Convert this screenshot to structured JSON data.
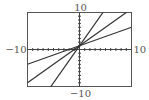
{
  "chart_data": {
    "type": "line",
    "title": "",
    "xlabel": "",
    "ylabel": "",
    "xlim": [
      -10,
      10
    ],
    "ylim": [
      -10,
      10
    ],
    "tick_step": 1,
    "grid": false,
    "legend": "none",
    "labels": {
      "xmin": "−10",
      "xmax": "10",
      "ymin": "−10",
      "ymax": "10"
    },
    "series": [
      {
        "name": "line-steep",
        "slope": 2,
        "intercept": 1
      },
      {
        "name": "line-middle",
        "slope": 1,
        "intercept": 1
      },
      {
        "name": "line-shallow",
        "slope": 0.5,
        "intercept": 1
      }
    ],
    "colors": {
      "frame": "#555555",
      "axis": "#444444",
      "line": "#333333"
    }
  }
}
